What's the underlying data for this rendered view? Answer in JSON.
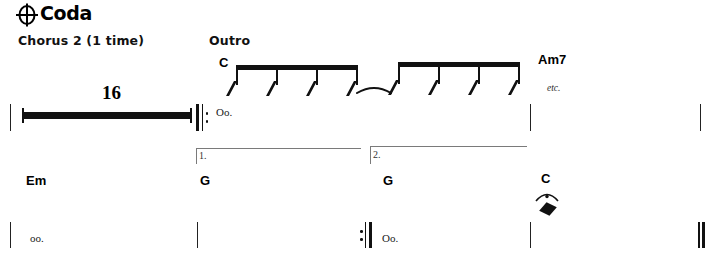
{
  "page": {
    "width": 709,
    "height": 264,
    "background": "#ffffff",
    "ink_color": "#111111"
  },
  "heading": {
    "coda_symbol": "coda-icon",
    "title": "Coda"
  },
  "systems": [
    {
      "id": "system-1",
      "labels": [
        {
          "name": "chorus-label",
          "text": "Chorus 2 (1 time)",
          "x": 18,
          "y": 33
        },
        {
          "name": "outro-label",
          "text": "Outro",
          "x": 209,
          "y": 33
        }
      ],
      "chords": [
        {
          "name": "chord-c",
          "text": "C",
          "x": 219,
          "y": 55
        },
        {
          "name": "chord-am7",
          "text": "Am7",
          "x": 538,
          "y": 52
        }
      ],
      "lyrics": [
        {
          "name": "lyric-oo-1",
          "text": "Oo.",
          "x": 216,
          "y": 106
        }
      ],
      "annotations": [
        {
          "name": "etc-marking",
          "text": "etc.",
          "x": 547,
          "y": 83
        }
      ],
      "multi_measure_rest": {
        "name": "multi-measure-rest",
        "count": "16",
        "x": 22,
        "y": 106,
        "width": 170
      },
      "repeat_start": {
        "name": "repeat-start-sign",
        "x": 196,
        "y": 104
      },
      "barlines": [
        {
          "name": "barline",
          "x": 10,
          "y": 104
        },
        {
          "name": "barline",
          "x": 530,
          "y": 104
        },
        {
          "name": "barline",
          "x": 700,
          "y": 104
        }
      ],
      "beam_groups": [
        {
          "name": "beamed-slash-group",
          "x": 228,
          "y": 65,
          "width": 128,
          "slashes": 4
        },
        {
          "name": "beamed-slash-group",
          "x": 390,
          "y": 62,
          "width": 128,
          "slashes": 4
        }
      ],
      "tie": {
        "name": "tie-slur",
        "x": 355,
        "y": 84,
        "width": 35
      }
    },
    {
      "id": "system-2",
      "endings": [
        {
          "name": "ending-bracket-1",
          "number": "1.",
          "x": 196,
          "y": 148,
          "width": 165
        },
        {
          "name": "ending-bracket-2",
          "number": "2.",
          "x": 370,
          "y": 146,
          "width": 157
        }
      ],
      "chords": [
        {
          "name": "chord-em",
          "text": "Em",
          "x": 26,
          "y": 173
        },
        {
          "name": "chord-g-1",
          "text": "G",
          "x": 200,
          "y": 173
        },
        {
          "name": "chord-g-2",
          "text": "G",
          "x": 383,
          "y": 173
        },
        {
          "name": "chord-c-final",
          "text": "C",
          "x": 541,
          "y": 171
        }
      ],
      "lyrics": [
        {
          "name": "lyric-oo-2",
          "text": "oo.",
          "x": 30,
          "y": 232
        },
        {
          "name": "lyric-oo-3",
          "text": "Oo.",
          "x": 382,
          "y": 232
        }
      ],
      "fermata_note": {
        "name": "fermata-whole-note",
        "fermata": "fermata-icon",
        "notehead": "diamond-notehead-icon",
        "x": 538,
        "y": 190
      },
      "repeat_end": {
        "name": "repeat-end-sign",
        "x": 360,
        "y": 222
      },
      "barlines": [
        {
          "name": "barline",
          "x": 10,
          "y": 222
        },
        {
          "name": "barline",
          "x": 197,
          "y": 222
        },
        {
          "name": "barline",
          "x": 530,
          "y": 222
        }
      ],
      "final_barline": {
        "name": "final-barline",
        "x": 698,
        "y": 222
      }
    }
  ]
}
